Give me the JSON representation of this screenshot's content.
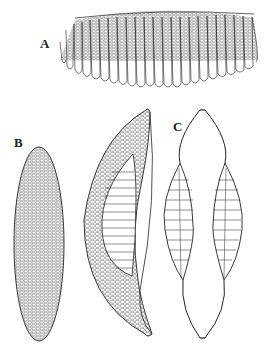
{
  "figure": {
    "panels": [
      {
        "id": "A",
        "label": "A",
        "description": "girdle/chain view colony of elongated frustules"
      },
      {
        "id": "B",
        "label": "B",
        "description": "valve view, elliptical-lanceolate with areolae"
      },
      {
        "id": "B2",
        "label": "",
        "description": "curved girdle view with striae"
      },
      {
        "id": "C",
        "label": "C",
        "description": "paired valves joined at poles"
      }
    ],
    "colors": {
      "ink": "#222222",
      "background": "#ffffff"
    }
  }
}
